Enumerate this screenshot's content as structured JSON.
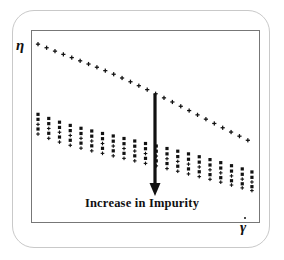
{
  "figure": {
    "background_color": "#ffffff",
    "card_border_color": "#c9c9c9",
    "frame_border_color": "#777777",
    "marker_color": "#111111",
    "arrow_color": "#111111"
  },
  "axes": {
    "y_label": "η",
    "x_label": "γ",
    "x_label_has_dot": true
  },
  "annotation": {
    "text": "Increase in Impurity",
    "arrow": {
      "direction": "down",
      "x": 155,
      "y_start": 94,
      "y_end": 196,
      "shaft_width": 3.2,
      "head_width": 11,
      "head_height": 13
    }
  },
  "chart_data": {
    "type": "scatter",
    "title": "",
    "xlabel": "γ̇",
    "ylabel": "η",
    "xlim": [
      0,
      1
    ],
    "ylim": [
      0,
      1
    ],
    "grid": false,
    "legend": "none",
    "annotations": [
      {
        "text": "Increase in Impurity",
        "type": "arrow-label",
        "arrow_direction": "down"
      }
    ],
    "series": [
      {
        "name": "pure",
        "marker": "plus",
        "marker_size": 4.2,
        "x": [
          0.0,
          0.04,
          0.079,
          0.118,
          0.157,
          0.196,
          0.235,
          0.274,
          0.313,
          0.352,
          0.391,
          0.43,
          0.469,
          0.508,
          0.547,
          0.586,
          0.625,
          0.664,
          0.703,
          0.742,
          0.781,
          0.82,
          0.859,
          0.898,
          0.937,
          0.976
        ],
        "y": [
          0.96,
          0.94,
          0.921,
          0.903,
          0.885,
          0.867,
          0.849,
          0.831,
          0.812,
          0.792,
          0.771,
          0.75,
          0.728,
          0.706,
          0.683,
          0.66,
          0.637,
          0.613,
          0.589,
          0.565,
          0.541,
          0.517,
          0.493,
          0.469,
          0.446,
          0.423
        ]
      },
      {
        "name": "impurity-1",
        "marker": "square",
        "marker_size": 4.0,
        "x": [
          0.0,
          0.05,
          0.1,
          0.15,
          0.2,
          0.25,
          0.3,
          0.35,
          0.4,
          0.45,
          0.5,
          0.55,
          0.6,
          0.65,
          0.7,
          0.75,
          0.8,
          0.85,
          0.9,
          0.95,
          0.995
        ],
        "y": [
          0.568,
          0.545,
          0.524,
          0.506,
          0.49,
          0.475,
          0.461,
          0.447,
          0.433,
          0.419,
          0.405,
          0.391,
          0.377,
          0.362,
          0.347,
          0.331,
          0.315,
          0.298,
          0.281,
          0.263,
          0.246
        ]
      },
      {
        "name": "impurity-2",
        "marker": "square",
        "marker_size": 4.0,
        "x": [
          0.0,
          0.05,
          0.1,
          0.15,
          0.2,
          0.25,
          0.3,
          0.35,
          0.4,
          0.45,
          0.5,
          0.55,
          0.6,
          0.65,
          0.7,
          0.75,
          0.8,
          0.85,
          0.9,
          0.95,
          0.995
        ],
        "y": [
          0.54,
          0.516,
          0.495,
          0.477,
          0.461,
          0.446,
          0.432,
          0.418,
          0.404,
          0.39,
          0.376,
          0.362,
          0.347,
          0.332,
          0.317,
          0.301,
          0.285,
          0.268,
          0.251,
          0.233,
          0.216
        ]
      },
      {
        "name": "impurity-3",
        "marker": "plus",
        "marker_size": 3.6,
        "x": [
          0.0,
          0.05,
          0.1,
          0.15,
          0.2,
          0.25,
          0.3,
          0.35,
          0.4,
          0.45,
          0.5,
          0.55,
          0.6,
          0.65,
          0.7,
          0.75,
          0.8,
          0.85,
          0.9,
          0.95,
          0.995
        ],
        "y": [
          0.512,
          0.489,
          0.468,
          0.45,
          0.434,
          0.419,
          0.405,
          0.391,
          0.377,
          0.363,
          0.349,
          0.335,
          0.32,
          0.305,
          0.29,
          0.274,
          0.258,
          0.241,
          0.224,
          0.206,
          0.19
        ]
      },
      {
        "name": "impurity-4",
        "marker": "square",
        "marker_size": 4.0,
        "x": [
          0.0,
          0.05,
          0.1,
          0.15,
          0.2,
          0.25,
          0.3,
          0.35,
          0.4,
          0.45,
          0.5,
          0.55,
          0.6,
          0.65,
          0.7,
          0.75,
          0.8,
          0.85,
          0.9,
          0.95,
          0.995
        ],
        "y": [
          0.486,
          0.462,
          0.441,
          0.423,
          0.407,
          0.392,
          0.378,
          0.364,
          0.35,
          0.336,
          0.322,
          0.308,
          0.293,
          0.278,
          0.263,
          0.247,
          0.231,
          0.214,
          0.197,
          0.18,
          0.164
        ]
      },
      {
        "name": "impurity-5",
        "marker": "plus",
        "marker_size": 3.6,
        "x": [
          0.0,
          0.05,
          0.1,
          0.15,
          0.2,
          0.25,
          0.3,
          0.35,
          0.4,
          0.45,
          0.5,
          0.55,
          0.6,
          0.65,
          0.7,
          0.75,
          0.8,
          0.85,
          0.9,
          0.95,
          0.995
        ],
        "y": [
          0.458,
          0.434,
          0.413,
          0.395,
          0.379,
          0.364,
          0.35,
          0.336,
          0.322,
          0.308,
          0.294,
          0.28,
          0.265,
          0.25,
          0.235,
          0.22,
          0.205,
          0.189,
          0.173,
          0.157,
          0.142
        ]
      }
    ]
  }
}
